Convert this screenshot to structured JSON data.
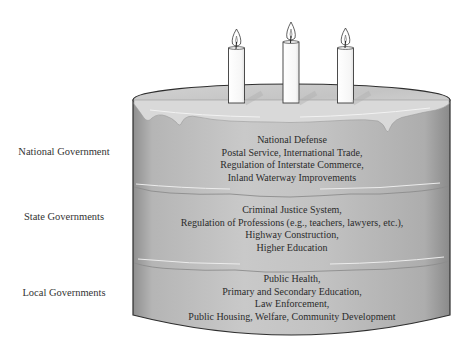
{
  "diagram": {
    "type": "layer-cake federalism illustration",
    "candles": {
      "count": 3,
      "icon": "candle-icon"
    },
    "colors": {
      "cake_body": "#b9b9b9",
      "cake_highlight": "#dcdcdc",
      "frosting": "#d6d6d6",
      "outline": "#2e2e2e",
      "candle": "#ffffff",
      "text": "#2b2b2b"
    },
    "layers": [
      {
        "label": "National Government",
        "items": [
          "National Defense",
          "Postal Service, International Trade,",
          "Regulation of Interstate Commerce,",
          "Inland Waterway Improvements"
        ]
      },
      {
        "label": "State Governments",
        "items": [
          "Criminal Justice System,",
          "Regulation of Professions (e.g., teachers, lawyers, etc.),",
          "Highway Construction,",
          "Higher Education"
        ]
      },
      {
        "label": "Local Governments",
        "items": [
          "Public Health,",
          "Primary and Secondary Education,",
          "Law Enforcement,",
          "Public Housing, Welfare, Community Development"
        ]
      }
    ]
  }
}
